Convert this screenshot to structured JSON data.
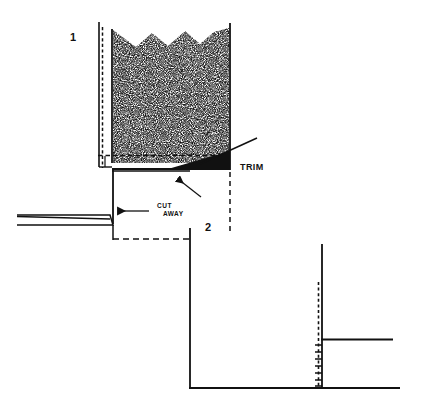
{
  "figure": {
    "background_color": "#ffffff",
    "ink_color": "#111111",
    "width": 421,
    "height": 411,
    "panels": [
      {
        "id": "panel-1",
        "number_label": "1",
        "number_x": 70,
        "number_y": 41,
        "description": "Filled container cross-section with stippled material, cut-away wall and trim line"
      },
      {
        "id": "panel-2",
        "number_label": "2",
        "number_x": 205,
        "number_y": 231,
        "description": "Lower cross-section with vertical post, dashed guide line, tick marks and baseline"
      }
    ],
    "callouts": [
      {
        "id": "trim",
        "label": "TRIM",
        "x": 240,
        "y": 170,
        "leader": "diagonal line from trim edge up-right to label"
      },
      {
        "id": "cut-away-line-1",
        "label": "CUT",
        "x": 157,
        "y": 208
      },
      {
        "id": "cut-away-line-2",
        "label": "AWAY",
        "x": 163,
        "y": 216
      }
    ],
    "arrows": [
      {
        "id": "cut-away-arrow",
        "direction": "left",
        "from_x": 148,
        "from_y": 211,
        "to_x": 117,
        "to_y": 211
      },
      {
        "id": "trim-pointer-arrow",
        "direction": "up-left",
        "from_x": 200,
        "from_y": 196,
        "to_x": 176,
        "to_y": 178
      }
    ],
    "stipple": {
      "fill_pattern": "random dot stipple",
      "dot_color": "#2b2b2b",
      "density_label": "dense"
    }
  }
}
